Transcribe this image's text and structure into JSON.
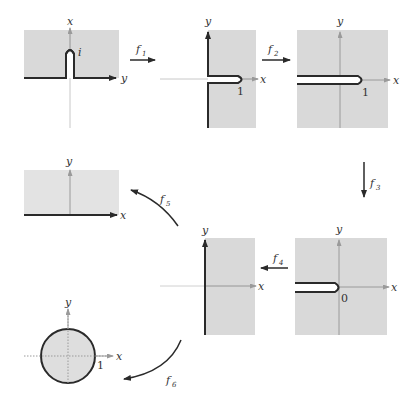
{
  "figure": {
    "colors": {
      "region_fill": "#d9d9d9",
      "boundary": "#2a2a2a",
      "axis": "#9a9a9a",
      "background": "#ffffff"
    },
    "panels": [
      {
        "id": "p1",
        "axis_h": "y",
        "axis_v": "x",
        "point_label": "i"
      },
      {
        "id": "p2",
        "axis_h": "x",
        "axis_v": "y",
        "point_label": "1"
      },
      {
        "id": "p3",
        "axis_h": "x",
        "axis_v": "y",
        "point_label": "1"
      },
      {
        "id": "p4",
        "axis_h": "x",
        "axis_v": "y"
      },
      {
        "id": "p5",
        "axis_h": "x",
        "axis_v": "y"
      },
      {
        "id": "p6",
        "axis_h": "x",
        "axis_v": "y",
        "point_label": "0"
      },
      {
        "id": "p7",
        "axis_h": "x",
        "axis_v": "y",
        "point_label": "1"
      }
    ],
    "maps": [
      {
        "name": "f",
        "sub": "1"
      },
      {
        "name": "f",
        "sub": "2"
      },
      {
        "name": "f",
        "sub": "3"
      },
      {
        "name": "f",
        "sub": "4"
      },
      {
        "name": "f",
        "sub": "5"
      },
      {
        "name": "f",
        "sub": "6"
      }
    ]
  }
}
